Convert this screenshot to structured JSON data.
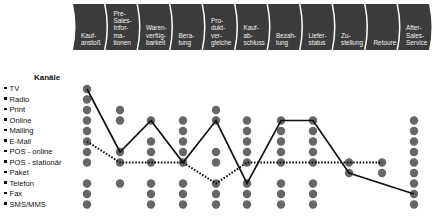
{
  "phases": [
    {
      "label": "Kauf-\nanstoß"
    },
    {
      "label": "Pre-\nSales-\nInfor-\nma-\ntionen"
    },
    {
      "label": "Waren-\nverfüg-\nbarkeit"
    },
    {
      "label": "Bera-\ntung"
    },
    {
      "label": "Pro-\ndukt-\nver-\ngleiche"
    },
    {
      "label": "Kauf-\nab-\nschluss"
    },
    {
      "label": "Bezah-\nlung"
    },
    {
      "label": "Liefer-\nstatus"
    },
    {
      "label": "Zu-\nstellung"
    },
    {
      "label": "Retoure"
    },
    {
      "label": "After-\nSales-\nService"
    }
  ],
  "channels": {
    "title": "Kanäle",
    "items": [
      "TV",
      "Radio",
      "Print",
      "Online",
      "Mailing",
      "E-Mail",
      "POS - online",
      "POS - stationär",
      "Paket",
      "Telefon",
      "Fax",
      "SMS/MMS"
    ]
  },
  "matrix": {
    "available": [
      [
        0,
        1,
        2,
        3,
        4,
        5,
        6,
        7,
        9,
        10,
        11
      ],
      [
        2,
        3,
        6,
        7,
        9
      ],
      [
        3,
        5,
        6,
        7,
        9,
        10,
        11
      ],
      [
        3,
        4,
        5,
        6,
        7,
        9,
        10,
        11
      ],
      [
        2,
        3,
        6,
        7,
        9,
        10,
        11
      ],
      [
        3,
        4,
        5,
        6,
        7,
        9,
        10,
        11
      ],
      [
        3,
        4,
        5,
        6,
        7,
        9,
        10,
        11
      ],
      [
        3,
        4,
        5,
        6,
        7,
        9,
        10,
        11
      ],
      [
        7,
        8
      ],
      [
        7,
        8
      ],
      [
        3,
        4,
        5,
        6,
        7,
        8,
        9,
        10,
        11
      ]
    ],
    "journeys": [
      {
        "name": "solid-journey",
        "style": "solid",
        "points": [
          [
            0,
            0
          ],
          [
            1,
            6
          ],
          [
            2,
            3
          ],
          [
            3,
            7
          ],
          [
            4,
            3
          ],
          [
            5,
            9
          ],
          [
            6,
            3
          ],
          [
            7,
            3
          ],
          [
            8,
            8
          ],
          [
            10,
            10
          ]
        ]
      },
      {
        "name": "dotted-journey",
        "style": "dotted",
        "points": [
          [
            0,
            5
          ],
          [
            1,
            7
          ],
          [
            2,
            7
          ],
          [
            3,
            7
          ],
          [
            4,
            9
          ],
          [
            5,
            7
          ],
          [
            6,
            7
          ],
          [
            7,
            7
          ],
          [
            8,
            7
          ],
          [
            9,
            7
          ]
        ]
      }
    ]
  },
  "colors": {
    "chevron": "#3c3c3c",
    "dot": "#666666",
    "line": "#111111",
    "text": "#111111"
  }
}
